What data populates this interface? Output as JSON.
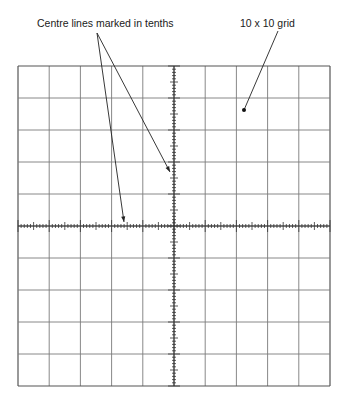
{
  "annotations": {
    "centre_lines": "Centre lines marked in tenths",
    "grid": "10 x 10 grid"
  },
  "diagram": {
    "type": "oscilloscope graticule",
    "divisions_x": 10,
    "divisions_y": 10,
    "minor_ticks_per_division": 10,
    "grid_left": 18,
    "grid_top": 66,
    "grid_right": 330,
    "grid_bottom": 386,
    "line_color": "#7a7a7a",
    "border_color": "#555555",
    "arrows": [
      {
        "from": [
          97,
          33
        ],
        "to": [
          124,
          222
        ]
      },
      {
        "from": [
          97,
          33
        ],
        "to": [
          170,
          172
        ]
      },
      {
        "from": [
          278,
          31
        ],
        "to": [
          244,
          110
        ]
      }
    ]
  }
}
